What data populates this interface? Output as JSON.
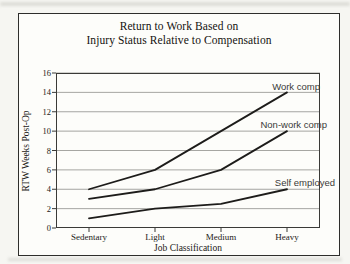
{
  "figure": {
    "title_line1": "Return to Work Based on",
    "title_line2": "Injury Status Relative to Compensation"
  },
  "chart_data": {
    "type": "line",
    "title": "Return to Work Based on Injury Status Relative to Compensation",
    "categories": [
      "Sedentary",
      "Light",
      "Medium",
      "Heavy"
    ],
    "series": [
      {
        "name": "Work comp",
        "values": [
          4,
          6,
          10,
          14
        ]
      },
      {
        "name": "Non-work comp",
        "values": [
          3,
          4,
          6,
          10
        ]
      },
      {
        "name": "Self employed",
        "values": [
          1,
          2,
          2.5,
          4
        ]
      }
    ],
    "xlabel": "Job Classification",
    "ylabel": "RTW Weeks Post-Op",
    "ylim": [
      0,
      16
    ],
    "yticks": [
      0,
      2,
      4,
      6,
      8,
      10,
      12,
      14,
      16
    ],
    "grid": "horizontal",
    "legend_position": "inline-labels"
  },
  "colors": {
    "line": "#1d1c1a",
    "grid": "#8f8f8c",
    "plot_border": "#3a3a37",
    "tick": "#3a3a37",
    "figure_background": "#fdfdfa",
    "page_background": "#f6f6f2"
  }
}
